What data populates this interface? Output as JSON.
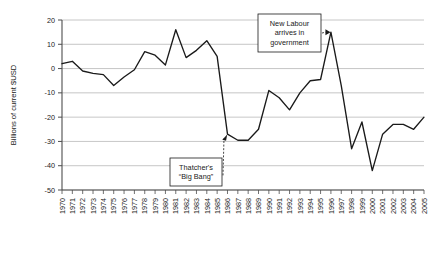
{
  "chart_data": {
    "type": "line",
    "title": "",
    "xlabel": "",
    "ylabel": "Billions of current $USD",
    "ylim": [
      -50,
      20
    ],
    "xlim": [
      1970,
      2005
    ],
    "grid": true,
    "legend": "none",
    "ytick_labels": [
      "20",
      "10",
      "0",
      "-10",
      "-20",
      "-30",
      "-40",
      "-50"
    ],
    "ytick_values": [
      20,
      10,
      0,
      -10,
      -20,
      -30,
      -40,
      -50
    ],
    "categories": [
      "1970",
      "1971",
      "1972",
      "1973",
      "1974",
      "1975",
      "1976",
      "1977",
      "1978",
      "1979",
      "1980",
      "1981",
      "1982",
      "1983",
      "1984",
      "1985",
      "1986",
      "1987",
      "1988",
      "1989",
      "1990",
      "1991",
      "1992",
      "1993",
      "1994",
      "1995",
      "1996",
      "1997",
      "1998",
      "1999",
      "2000",
      "2001",
      "2002",
      "2003",
      "2004",
      "2005"
    ],
    "values": [
      2,
      3,
      -1,
      -2,
      -2.5,
      -7,
      -3.5,
      -0.5,
      7,
      5.5,
      1.5,
      16,
      4.5,
      7.5,
      11.5,
      5,
      -27,
      -29.5,
      -29.5,
      -25,
      -9,
      -12,
      -17,
      -10,
      -5,
      -4.5,
      15,
      -7,
      -33,
      -22,
      -42,
      -27,
      -23,
      -23,
      -25,
      -20
    ],
    "annotations": [
      {
        "id": "thatcher",
        "lines": [
          "Thatcher's",
          "“Big Bang”"
        ],
        "target_year": 1986,
        "target_value": -27
      },
      {
        "id": "new-labour",
        "lines": [
          "New Labour",
          "arrives in",
          "government"
        ],
        "target_year": 1996,
        "target_value": 15
      }
    ]
  },
  "colors": {
    "series": "#1a1a1a",
    "grid": "#b8b8b8",
    "axis": "#4d4d4d",
    "background": "#ffffff"
  }
}
